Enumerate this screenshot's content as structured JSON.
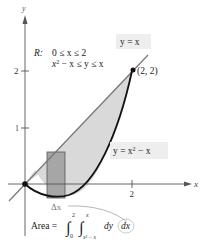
{
  "figure": {
    "axes": {
      "x_label": "x",
      "y_label": "y",
      "x_ticks": [
        {
          "value": 2,
          "label": "2"
        }
      ],
      "y_ticks": [
        {
          "value": 1,
          "label": "1"
        },
        {
          "value": 2,
          "label": "2"
        }
      ]
    },
    "region": {
      "label_R": "R:",
      "line1": "0 ≤ x ≤ 2",
      "line2_a": "x",
      "line2_sup": "2",
      "line2_b": " − x ≤ y ≤ x"
    },
    "curve_line": {
      "label": "y = x"
    },
    "curve_parabola": {
      "label_a": "y = x",
      "label_sup": "2",
      "label_b": " − x"
    },
    "point": {
      "label": "(2, 2)"
    },
    "delta": {
      "label": "Δx"
    },
    "area_formula": {
      "prefix": "Area = ",
      "outer_lower": "0",
      "outer_upper": "2",
      "inner_lower": "x² − x",
      "inner_upper": "x",
      "integrand": "dy",
      "outer_diff": "dx"
    },
    "colors": {
      "shade": "#d9d9d9",
      "rect": "#a6a6a6",
      "curve": "#111111",
      "line": "#777777",
      "axis": "#555555",
      "label_bg": "#eeeeee"
    }
  }
}
